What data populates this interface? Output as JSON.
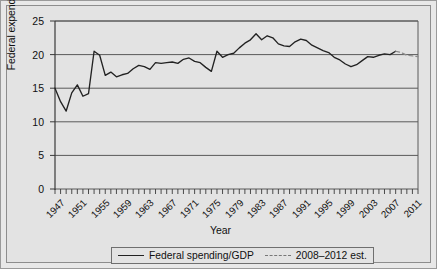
{
  "chart_data": {
    "type": "line",
    "title": "",
    "xlabel": "Year",
    "ylabel": "Federal expending/GDP",
    "xlim": [
      1947,
      2012
    ],
    "ylim": [
      0,
      25
    ],
    "yticks": [
      0,
      5,
      10,
      15,
      20,
      25
    ],
    "xticks": [
      1947,
      1951,
      1955,
      1959,
      1963,
      1967,
      1971,
      1975,
      1979,
      1983,
      1987,
      1991,
      1995,
      1999,
      2003,
      2007,
      2011
    ],
    "grid": true,
    "legend_position": "below",
    "series": [
      {
        "name": "Federal spending/GDP",
        "style": "solid",
        "color": "#222222",
        "x": [
          1947,
          1948,
          1949,
          1950,
          1951,
          1952,
          1953,
          1954,
          1955,
          1956,
          1957,
          1958,
          1959,
          1960,
          1961,
          1962,
          1963,
          1964,
          1965,
          1966,
          1967,
          1968,
          1969,
          1970,
          1971,
          1972,
          1973,
          1974,
          1975,
          1976,
          1977,
          1978,
          1979,
          1980,
          1981,
          1982,
          1983,
          1984,
          1985,
          1986,
          1987,
          1988,
          1989,
          1990,
          1991,
          1992,
          1993,
          1994,
          1995,
          1996,
          1997,
          1998,
          1999,
          2000,
          2001,
          2002,
          2003,
          2004,
          2005,
          2006,
          2007,
          2008
        ],
        "values": [
          15.0,
          13.0,
          11.6,
          14.3,
          15.5,
          13.8,
          14.2,
          20.5,
          19.9,
          16.9,
          17.4,
          16.7,
          17.0,
          17.2,
          17.9,
          18.4,
          18.2,
          17.8,
          18.8,
          18.7,
          18.8,
          18.9,
          18.7,
          19.3,
          19.5,
          19.0,
          18.8,
          18.1,
          17.5,
          20.5,
          19.6,
          20.0,
          20.2,
          21.0,
          21.7,
          22.2,
          23.1,
          22.2,
          22.8,
          22.5,
          21.6,
          21.3,
          21.2,
          21.9,
          22.3,
          22.1,
          21.4,
          21.0,
          20.6,
          20.3,
          19.6,
          19.2,
          18.6,
          18.2,
          18.5,
          19.1,
          19.7,
          19.6,
          19.9,
          20.1,
          20.0,
          20.5
        ]
      },
      {
        "name": "2008–2012 est.",
        "style": "dashed",
        "color": "#8a8a8a",
        "x": [
          2008,
          2009,
          2010,
          2011,
          2012
        ],
        "values": [
          20.5,
          20.3,
          19.9,
          19.8,
          19.7
        ]
      }
    ]
  },
  "legend": {
    "items": [
      {
        "label": "Federal spending/GDP",
        "style": "solid"
      },
      {
        "label": "2008–2012 est.",
        "style": "dashed"
      }
    ]
  }
}
